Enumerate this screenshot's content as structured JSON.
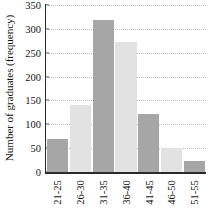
{
  "chart_data": {
    "type": "bar",
    "title": "",
    "subtitle": "",
    "xlabel": "",
    "ylabel": "Number of graduates (frequency)",
    "categories": [
      "21-25",
      "26-30",
      "31-35",
      "36-40",
      "41-45",
      "46-50",
      "51-55"
    ],
    "values": [
      70,
      140,
      318,
      273,
      122,
      51,
      23
    ],
    "series": [
      {
        "name": "Number of graduates",
        "values": [
          70,
          140,
          318,
          273,
          122,
          51,
          23
        ]
      }
    ],
    "ylim": [
      0,
      350
    ],
    "yticks": [
      0,
      50,
      100,
      150,
      200,
      250,
      300,
      350
    ],
    "ytick_labels": [
      "0",
      "50",
      "100",
      "150",
      "200",
      "250",
      "300",
      "350"
    ],
    "grid": "horizontal-dotted",
    "legend": "none",
    "bar_colors": [
      "#a6a6a6",
      "#e2e2e2",
      "#a6a6a6",
      "#e2e2e2",
      "#a6a6a6",
      "#e2e2e2",
      "#a6a6a6"
    ],
    "xtick_rotation": 90,
    "annotations": []
  },
  "colors": {
    "bar_dark": "#a6a6a6",
    "bar_light": "#e2e2e2",
    "axis": "#2b2b2b",
    "grid": "#b9b9b9",
    "text": "#141414",
    "background": "#ffffff"
  }
}
